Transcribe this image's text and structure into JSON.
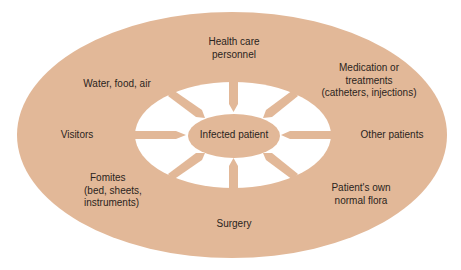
{
  "diagram": {
    "title": "",
    "center": "Infected patient",
    "sources": [
      {
        "id": "health-care-personnel",
        "lines": [
          "Health care",
          "personnel"
        ]
      },
      {
        "id": "medication",
        "lines": [
          "Medication or",
          "treatments",
          "(catheters,  injections)"
        ]
      },
      {
        "id": "other-patients",
        "lines": [
          "Other patients"
        ]
      },
      {
        "id": "normal-flora",
        "lines": [
          "Patient's own",
          "normal flora"
        ]
      },
      {
        "id": "surgery",
        "lines": [
          "Surgery"
        ]
      },
      {
        "id": "fomites",
        "lines": [
          "Fomites",
          "(bed, sheets,",
          "instruments)"
        ]
      },
      {
        "id": "visitors",
        "lines": [
          "Visitors"
        ]
      },
      {
        "id": "water-food-air",
        "lines": [
          "Water, food, air"
        ]
      }
    ]
  },
  "colors": {
    "ring": "#e2b898",
    "inner": "#ffffff",
    "text": "#2a2420"
  }
}
